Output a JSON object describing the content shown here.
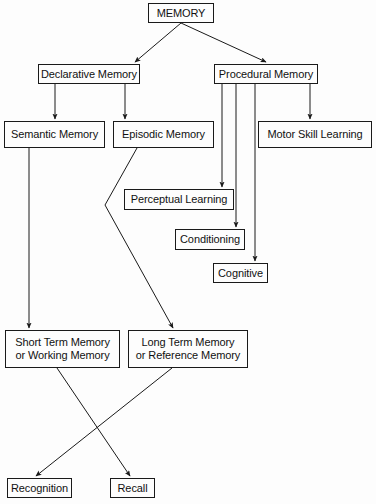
{
  "diagram": {
    "background_color": "#fdfdfd",
    "line_color": "#1a1a1a",
    "box_border_color": "#1a1a1a",
    "text_color": "#111111",
    "nodes": [
      {
        "id": "memory",
        "label": "MEMORY",
        "x": 148,
        "y": 3,
        "w": 66,
        "h": 20
      },
      {
        "id": "declarative",
        "label": "Declarative Memory",
        "x": 38,
        "y": 64,
        "w": 102,
        "h": 20
      },
      {
        "id": "procedural",
        "label": "Procedural Memory",
        "x": 214,
        "y": 64,
        "w": 104,
        "h": 20
      },
      {
        "id": "semantic",
        "label": "Semantic Memory",
        "x": 4,
        "y": 121,
        "w": 101,
        "h": 27
      },
      {
        "id": "episodic",
        "label": "Episodic Memory",
        "x": 113,
        "y": 121,
        "w": 101,
        "h": 27
      },
      {
        "id": "motor",
        "label": "Motor Skill Learning",
        "x": 258,
        "y": 121,
        "w": 114,
        "h": 27
      },
      {
        "id": "perceptual",
        "label": "Perceptual Learning",
        "x": 124,
        "y": 189,
        "w": 110,
        "h": 21
      },
      {
        "id": "conditioning",
        "label": "Conditioning",
        "x": 175,
        "y": 229,
        "w": 70,
        "h": 21
      },
      {
        "id": "cognitive",
        "label": "Cognitive",
        "x": 213,
        "y": 263,
        "w": 55,
        "h": 20
      },
      {
        "id": "short_term",
        "label": "Short Term Memory\nor Working Memory",
        "x": 5,
        "y": 330,
        "w": 115,
        "h": 38
      },
      {
        "id": "long_term",
        "label": "Long Term Memory\nor Reference Memory",
        "x": 128,
        "y": 330,
        "w": 120,
        "h": 38
      },
      {
        "id": "recognition",
        "label": "Recognition",
        "x": 7,
        "y": 478,
        "w": 65,
        "h": 20
      },
      {
        "id": "recall",
        "label": "Recall",
        "x": 110,
        "y": 478,
        "w": 45,
        "h": 20
      }
    ],
    "edges": [
      {
        "id": "memory-to-declarative",
        "from": "memory",
        "to": "declarative",
        "points": "181,23 135,62"
      },
      {
        "id": "memory-to-procedural",
        "from": "memory",
        "to": "procedural",
        "points": "181,23 266,62"
      },
      {
        "id": "declarative-to-semantic",
        "from": "declarative",
        "to": "semantic",
        "points": "55,84 55,119"
      },
      {
        "id": "declarative-to-episodic",
        "from": "declarative",
        "to": "episodic",
        "points": "125,84 125,119"
      },
      {
        "id": "procedural-to-perceptual",
        "from": "procedural",
        "to": "perceptual",
        "points": "222,84 222,187"
      },
      {
        "id": "procedural-to-conditioning",
        "from": "procedural",
        "to": "conditioning",
        "points": "236,84 236,227"
      },
      {
        "id": "procedural-to-cognitive",
        "from": "procedural",
        "to": "cognitive",
        "points": "255,84 255,261"
      },
      {
        "id": "procedural-to-motor",
        "from": "procedural",
        "to": "motor",
        "points": "310,84 310,119"
      },
      {
        "id": "semantic-to-short-term",
        "from": "semantic",
        "to": "short_term",
        "points": "29,148 29,328"
      },
      {
        "id": "episodic-to-long-term",
        "from": "episodic",
        "to": "long_term",
        "points": "137,148 105,205 173,328"
      },
      {
        "id": "short-term-to-recall",
        "from": "short_term",
        "to": "recall",
        "points": "57,368 130,476"
      },
      {
        "id": "long-term-to-recognition",
        "from": "long_term",
        "to": "recognition",
        "points": "172,368 36,476"
      }
    ]
  }
}
